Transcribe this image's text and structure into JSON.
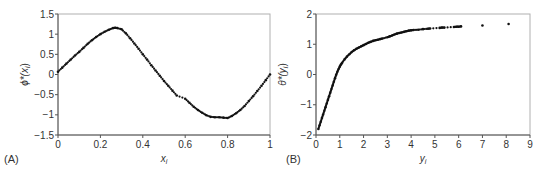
{
  "chart_data": [
    {
      "panel_label": "(A)",
      "type": "scatter",
      "title": "",
      "xlabel": "x",
      "xlabel_sub": "i",
      "ylabel": "ϕ*(x",
      "ylabel_sub": "i",
      "ylabel_close": ")",
      "xlim": [
        0,
        1
      ],
      "ylim": [
        -1.5,
        1.5
      ],
      "xticks": [
        0,
        0.2,
        0.4,
        0.6,
        0.8,
        1
      ],
      "xtick_labels": [
        "0",
        "0.2",
        "0.4",
        "0.6",
        "0.8",
        "1"
      ],
      "yticks": [
        -1.5,
        -1,
        -0.5,
        0,
        0.5,
        1,
        1.5
      ],
      "ytick_labels": [
        "−1.5",
        "−1",
        "−0.5",
        "0",
        "0.5",
        "1",
        "1.5"
      ],
      "grid": false,
      "series": [
        {
          "name": "phi_star",
          "x": [
            0.0,
            0.02,
            0.04,
            0.06,
            0.08,
            0.1,
            0.12,
            0.14,
            0.16,
            0.18,
            0.2,
            0.22,
            0.24,
            0.26,
            0.27,
            0.28,
            0.3,
            0.32,
            0.34,
            0.36,
            0.38,
            0.4,
            0.42,
            0.44,
            0.46,
            0.48,
            0.5,
            0.52,
            0.54,
            0.56,
            0.6,
            0.62,
            0.64,
            0.66,
            0.68,
            0.7,
            0.72,
            0.74,
            0.76,
            0.78,
            0.8,
            0.82,
            0.84,
            0.86,
            0.88,
            0.9,
            0.92,
            0.94,
            0.96,
            0.98,
            1.0
          ],
          "y": [
            0.07,
            0.17,
            0.27,
            0.37,
            0.47,
            0.56,
            0.66,
            0.76,
            0.85,
            0.93,
            1.0,
            1.06,
            1.11,
            1.15,
            1.16,
            1.15,
            1.12,
            1.02,
            0.9,
            0.77,
            0.64,
            0.5,
            0.37,
            0.23,
            0.1,
            -0.03,
            -0.16,
            -0.28,
            -0.4,
            -0.52,
            -0.6,
            -0.7,
            -0.8,
            -0.88,
            -0.95,
            -1.01,
            -1.05,
            -1.06,
            -1.06,
            -1.07,
            -1.08,
            -1.03,
            -0.96,
            -0.88,
            -0.78,
            -0.66,
            -0.54,
            -0.41,
            -0.28,
            -0.14,
            0.0
          ]
        }
      ]
    },
    {
      "panel_label": "(B)",
      "type": "scatter",
      "title": "",
      "xlabel": "y",
      "xlabel_sub": "i",
      "ylabel": "θ*(y",
      "ylabel_sub": "i",
      "ylabel_close": ")",
      "xlim": [
        0,
        9
      ],
      "ylim": [
        -2,
        2
      ],
      "xticks": [
        0,
        1,
        2,
        3,
        4,
        5,
        6,
        7,
        8,
        9
      ],
      "xtick_labels": [
        "0",
        "1",
        "2",
        "3",
        "4",
        "5",
        "6",
        "7",
        "8",
        "9"
      ],
      "yticks": [
        -2,
        -1,
        0,
        1,
        2
      ],
      "ytick_labels": [
        "−2",
        "−1",
        "0",
        "1",
        "2"
      ],
      "grid": false,
      "series": [
        {
          "name": "theta_star",
          "x": [
            0.1,
            0.15,
            0.2,
            0.25,
            0.3,
            0.35,
            0.4,
            0.45,
            0.5,
            0.55,
            0.6,
            0.65,
            0.7,
            0.75,
            0.8,
            0.85,
            0.9,
            0.95,
            1.0,
            1.05,
            1.1,
            1.2,
            1.3,
            1.4,
            1.5,
            1.6,
            1.7,
            1.8,
            1.9,
            2.0,
            2.1,
            2.2,
            2.3,
            2.4,
            2.5,
            2.6,
            2.7,
            2.8,
            3.0,
            3.1,
            3.2,
            3.3,
            3.4,
            3.5,
            3.6,
            3.7,
            3.8,
            3.9,
            4.0,
            4.1,
            4.3,
            4.5,
            4.7,
            4.8,
            5.2,
            5.3,
            5.4,
            5.8,
            5.9,
            6.0,
            6.1,
            7.0,
            8.1
          ],
          "y": [
            -1.8,
            -1.68,
            -1.56,
            -1.44,
            -1.32,
            -1.2,
            -1.08,
            -0.96,
            -0.84,
            -0.72,
            -0.6,
            -0.48,
            -0.36,
            -0.24,
            -0.12,
            -0.01,
            0.09,
            0.18,
            0.26,
            0.33,
            0.39,
            0.5,
            0.59,
            0.67,
            0.74,
            0.8,
            0.85,
            0.89,
            0.93,
            0.97,
            1.01,
            1.05,
            1.08,
            1.11,
            1.13,
            1.15,
            1.17,
            1.19,
            1.23,
            1.26,
            1.29,
            1.32,
            1.35,
            1.37,
            1.39,
            1.41,
            1.43,
            1.45,
            1.46,
            1.47,
            1.48,
            1.5,
            1.51,
            1.52,
            1.54,
            1.55,
            1.55,
            1.57,
            1.58,
            1.58,
            1.59,
            1.62,
            1.67
          ]
        }
      ]
    }
  ]
}
